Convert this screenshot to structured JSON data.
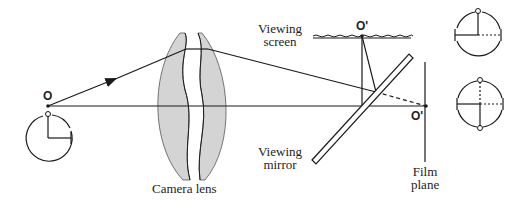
{
  "labels": {
    "object_point": "O",
    "image_point_screen": "O'",
    "image_point_film": "O'",
    "camera_lens": "Camera lens",
    "viewing_screen_line1": "Viewing",
    "viewing_screen_line2": "screen",
    "viewing_mirror_line1": "Viewing",
    "viewing_mirror_line2": "mirror",
    "film_plane_line1": "Film",
    "film_plane_line2": "plane"
  },
  "icons": {
    "object_orientation": "clock-orientation-icon",
    "screen_image_orientation": "clock-orientation-icon",
    "film_image_orientation": "clock-orientation-icon"
  },
  "colors": {
    "line": "#1a1a1a",
    "lens_fill": "#d4d4d4",
    "background": "#ffffff"
  }
}
